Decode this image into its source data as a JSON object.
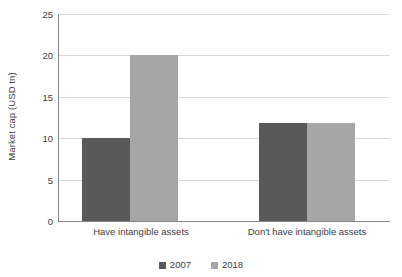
{
  "chart_data": {
    "type": "bar",
    "title": "",
    "subtitle": "",
    "xlabel": "",
    "ylabel": "Market cap (USD tn)",
    "categories": [
      "Have intangible assets",
      "Don't have intangible assets"
    ],
    "series": [
      {
        "name": "2007",
        "color": "#595959",
        "values": [
          10,
          11.8
        ]
      },
      {
        "name": "2018",
        "color": "#a6a6a6",
        "values": [
          20,
          11.8
        ]
      }
    ],
    "ylim": [
      0,
      25
    ],
    "ytick_values": [
      25,
      20,
      15,
      10,
      5,
      0
    ],
    "ytick_labels": [
      "25",
      "20",
      "15",
      "10",
      "5",
      "0"
    ],
    "grid": true,
    "grid_axis": "y",
    "legend_position": "bottom-center",
    "legend_entries": [
      "2007",
      "2018"
    ],
    "background_color": "#ffffff",
    "gridline_color": "#d9d9d9",
    "axis_color": "#868686",
    "text_color": "#404040"
  }
}
